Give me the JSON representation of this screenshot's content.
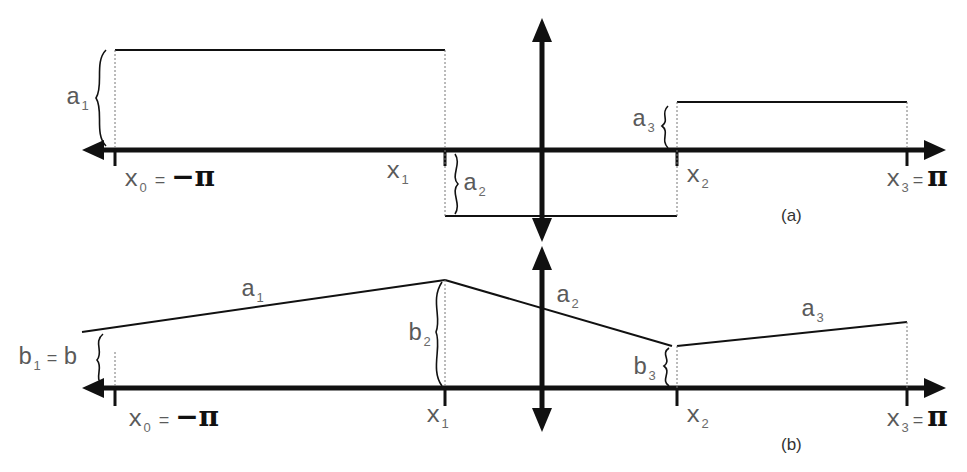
{
  "panel_a": {
    "caption": "(a)",
    "labels": {
      "a1": "a",
      "a1_sub": "1",
      "a2": "a",
      "a2_sub": "2",
      "a3": "a",
      "a3_sub": "3",
      "x0": "x",
      "x0_sub": "0",
      "x0_eq": "=",
      "x0_val": "−π",
      "x1": "x",
      "x1_sub": "1",
      "x2": "x",
      "x2_sub": "2",
      "x3": "x",
      "x3_sub": "3",
      "x3_eq": "=",
      "x3_val": "π"
    }
  },
  "panel_b": {
    "caption": "(b)",
    "labels": {
      "a1": "a",
      "a1_sub": "1",
      "a2": "a",
      "a2_sub": "2",
      "a3": "a",
      "a3_sub": "3",
      "b1": "b",
      "b1_sub": "1",
      "b1_eq": "=",
      "b1_val": "b",
      "b2": "b",
      "b2_sub": "2",
      "b3": "b",
      "b3_sub": "3",
      "x0": "x",
      "x0_sub": "0",
      "x0_eq": "=",
      "x0_val": "−π",
      "x1": "x",
      "x1_sub": "1",
      "x2": "x",
      "x2_sub": "2",
      "x3": "x",
      "x3_sub": "3",
      "x3_eq": "=",
      "x3_val": "π"
    }
  },
  "colors": {
    "stroke": "#111111",
    "label": "#5a5a5a",
    "dotted": "#777777"
  }
}
